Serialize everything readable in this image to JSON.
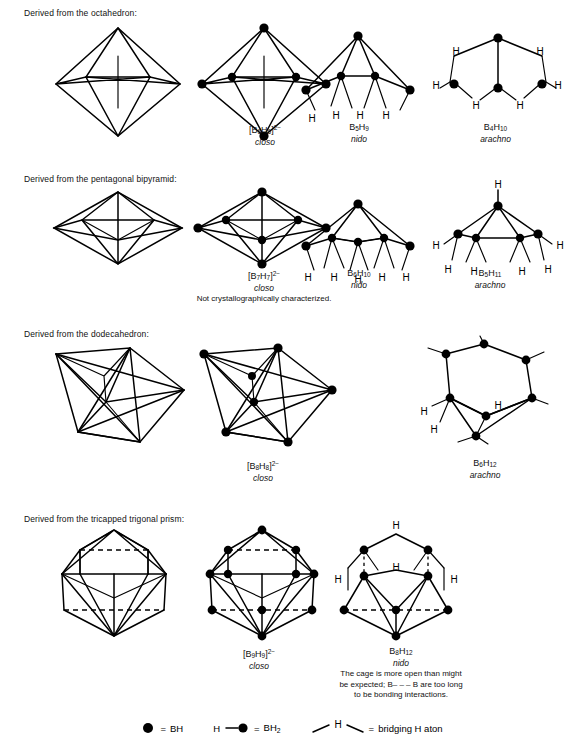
{
  "document": {
    "title": "Borane cluster structures derived from deltahedra"
  },
  "sections": [
    {
      "id": "octahedron",
      "heading": "Derived from the octahedron:",
      "structures": [
        {
          "name": "octahedron-parent",
          "formula": "",
          "type": "",
          "note": ""
        },
        {
          "name": "B6H6-2minus",
          "formula_base": "[B",
          "formula": "[B6H6]2-",
          "sub1": "6",
          "sub2": "6",
          "charge": "2−",
          "type": "closo",
          "note": ""
        },
        {
          "name": "B5H9",
          "formula": "B5H9",
          "sub1": "5",
          "sub2": "9",
          "type": "nido",
          "note": ""
        },
        {
          "name": "B4H10",
          "formula": "B4H10",
          "sub1": "4",
          "sub2": "10",
          "type": "arachno",
          "note": ""
        }
      ]
    },
    {
      "id": "pentagonal-bipyramid",
      "heading": "Derived from the pentagonal bipyramid:",
      "structures": [
        {
          "name": "pentagonal-bipyramid-parent",
          "formula": "",
          "type": "",
          "note": ""
        },
        {
          "name": "B7H7-2minus",
          "formula": "[B7H7]2-",
          "sub1": "7",
          "sub2": "7",
          "charge": "2−",
          "type": "closo",
          "note": "Not  crystallographically characterized."
        },
        {
          "name": "B6H10",
          "formula": "B6H10",
          "sub1": "6",
          "sub2": "10",
          "type": "nido",
          "note": ""
        },
        {
          "name": "B5H11",
          "formula": "B5H11",
          "sub1": "5",
          "sub2": "11",
          "type": "arachno",
          "note": ""
        }
      ]
    },
    {
      "id": "dodecahedron",
      "heading": "Derived from the dodecahedron:",
      "structures": [
        {
          "name": "dodecahedron-parent",
          "formula": "",
          "type": "",
          "note": ""
        },
        {
          "name": "B8H8-2minus",
          "formula": "[B8H8]2-",
          "sub1": "8",
          "sub2": "8",
          "charge": "2−",
          "type": "closo",
          "note": ""
        },
        {
          "name": "B6H12",
          "formula": "B6H12",
          "sub1": "6",
          "sub2": "12",
          "type": "arachno",
          "note": ""
        }
      ]
    },
    {
      "id": "tricapped-trigonal-prism",
      "heading": "Derived from the tricapped trigonal prism:",
      "structures": [
        {
          "name": "tricapped-trigonal-prism-parent",
          "formula": "",
          "type": "",
          "note": ""
        },
        {
          "name": "B9H9-2minus",
          "formula": "[B9H9]2-",
          "sub1": "9",
          "sub2": "9",
          "charge": "2−",
          "type": "closo",
          "note": ""
        },
        {
          "name": "B8H12",
          "formula": "B8H12",
          "sub1": "8",
          "sub2": "12",
          "type": "nido",
          "note": "The cage is more open than might be expected; B– – – B are too long to be bonding interactions."
        }
      ]
    }
  ],
  "captions": {
    "b6h6": {
      "b": "B",
      "sub1": "6",
      "h": "H",
      "sub2": "6",
      "charge": "2−",
      "type": "closo"
    },
    "b5h9": {
      "b": "B",
      "sub1": "5",
      "h": "H",
      "sub2": "9",
      "type": "nido"
    },
    "b4h10": {
      "b": "B",
      "sub1": "4",
      "h": "H",
      "sub2": "10",
      "type": "arachno"
    },
    "b7h7": {
      "b": "B",
      "sub1": "7",
      "h": "H",
      "sub2": "7",
      "charge": "2−",
      "type": "closo",
      "note": "Not  crystallographically characterized."
    },
    "b6h10": {
      "b": "B",
      "sub1": "6",
      "h": "H",
      "sub2": "10",
      "type": "nido"
    },
    "b5h11": {
      "b": "B",
      "sub1": "5",
      "h": "H",
      "sub2": "11",
      "type": "arachno"
    },
    "b8h8": {
      "b": "B",
      "sub1": "8",
      "h": "H",
      "sub2": "8",
      "charge": "2−",
      "type": "closo"
    },
    "b6h12": {
      "b": "B",
      "sub1": "6",
      "h": "H",
      "sub2": "12",
      "type": "arachno"
    },
    "b9h9": {
      "b": "B",
      "sub1": "9",
      "h": "H",
      "sub2": "9",
      "charge": "2−",
      "type": "closo"
    },
    "b8h12": {
      "b": "B",
      "sub1": "8",
      "h": "H",
      "sub2": "12",
      "type": "nido",
      "note_line1": "The cage is more open than might",
      "note_line2": "be expected; B– – – B are too long",
      "note_line3": "to be bonding interactions."
    }
  },
  "hydrogen_label": "H",
  "legend": {
    "items": [
      {
        "name": "bh-key",
        "symbol": "filled-circle",
        "equals": "=",
        "label": "BH",
        "label_sub": ""
      },
      {
        "name": "bh2-key",
        "symbol": "h-dash-circle",
        "equals": "=",
        "label": "BH",
        "label_sub": "2",
        "prefix": "H"
      },
      {
        "name": "bridging-h-key",
        "symbol": "bridge",
        "equals": "=",
        "label": "bridging H aton",
        "bridge_label": "H"
      }
    ]
  },
  "colors": {
    "ink": "#000000",
    "background": "#ffffff"
  }
}
